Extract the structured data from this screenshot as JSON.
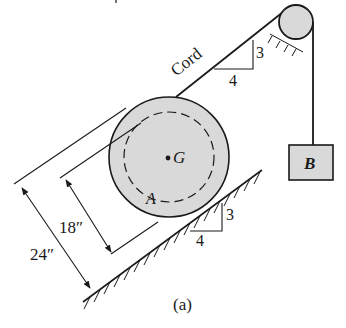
{
  "figure": {
    "caption": "(a)",
    "top_fragment": "",
    "labels": {
      "cord": "Cord",
      "center": "G",
      "contact_point": "A",
      "block": "B",
      "cord_slope_run": "4",
      "cord_slope_rise": "3",
      "incline_slope_run": "4",
      "incline_slope_rise": "3",
      "inner_diameter": "18″",
      "outer_diameter": "24″"
    },
    "colors": {
      "line": "#1a1a1a",
      "fill": "#d9d9d9",
      "background": "#ffffff"
    }
  }
}
